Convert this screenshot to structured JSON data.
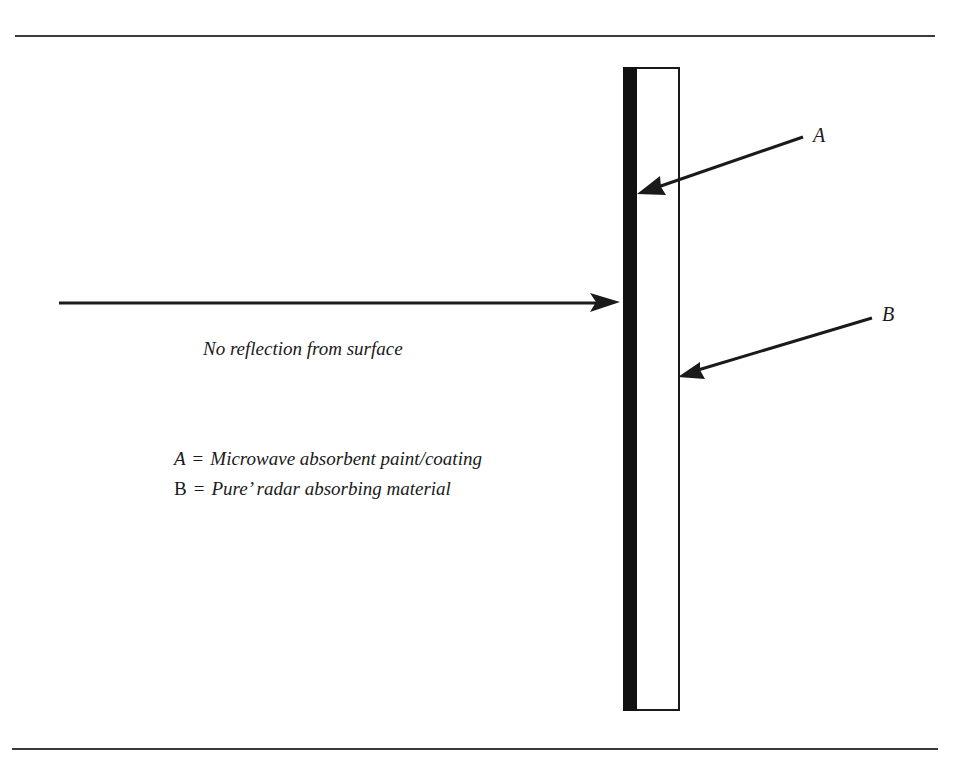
{
  "figure": {
    "incident_caption": "No reflection from surface",
    "markers": {
      "a": "A",
      "b": "B"
    },
    "legend": [
      {
        "key": "A",
        "equals": "=",
        "text": "Microwave absorbent paint/coating"
      },
      {
        "key": "B",
        "equals": "=",
        "text": "Pure’ radar absorbing material"
      }
    ],
    "colors": {
      "ink": "#1a1a1a",
      "coating": "#111111",
      "background": "#ffffff"
    }
  }
}
